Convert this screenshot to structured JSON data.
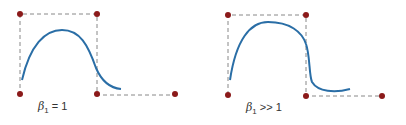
{
  "diagrams": [
    {
      "label_symbol": "β",
      "label_sub": "1",
      "label_rel": " = 1",
      "dot_color": "#8b1a1a",
      "curve_color": "#2a6ea6"
    },
    {
      "label_symbol": "β",
      "label_sub": "1",
      "label_rel": " >> 1",
      "dot_color": "#8b1a1a",
      "curve_color": "#2a6ea6"
    }
  ]
}
